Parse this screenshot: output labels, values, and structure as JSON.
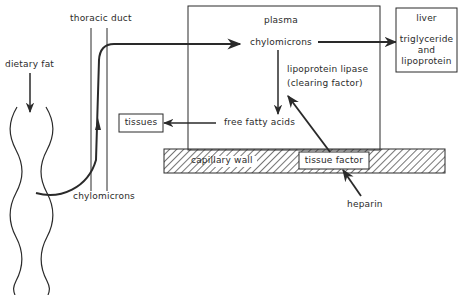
{
  "diagram": {
    "type": "flow-diagram",
    "colors": {
      "ink": "#2a2a2a",
      "background": "#ffffff"
    },
    "labels": {
      "dietary_fat": "dietary fat",
      "thoracic_duct": "thoracic duct",
      "chylomicrons_bottom": "chylomicrons",
      "plasma": "plasma",
      "chylomicrons_plasma": "chylomicrons",
      "lipoprotein_lipase": "lipoprotein lipase",
      "clearing_factor": "(clearing factor)",
      "free_fatty_acids": "free fatty acids",
      "tissues": "tissues",
      "capillary_wall": "capillary wall",
      "tissue_factor": "tissue factor",
      "heparin": "heparin",
      "liver_title": "liver",
      "liver_line1": "triglyceride",
      "liver_line2": "and",
      "liver_line3": "lipoprotein"
    },
    "nodes": [
      {
        "id": "intestine",
        "label": "dietary fat"
      },
      {
        "id": "thoracic-duct",
        "label": "thoracic duct"
      },
      {
        "id": "plasma",
        "label": "plasma"
      },
      {
        "id": "chylomicrons",
        "label": "chylomicrons"
      },
      {
        "id": "free-fatty-acids",
        "label": "free fatty acids"
      },
      {
        "id": "tissues",
        "label": "tissues"
      },
      {
        "id": "liver",
        "label": "liver triglyceride and lipoprotein"
      },
      {
        "id": "capillary-wall",
        "label": "capillary wall"
      },
      {
        "id": "tissue-factor",
        "label": "tissue factor"
      },
      {
        "id": "heparin",
        "label": "heparin"
      }
    ],
    "edges": [
      {
        "from": "dietary fat",
        "to": "intestine"
      },
      {
        "from": "intestine",
        "to": "thoracic-duct",
        "label": "chylomicrons"
      },
      {
        "from": "thoracic-duct",
        "to": "chylomicrons"
      },
      {
        "from": "chylomicrons",
        "to": "liver"
      },
      {
        "from": "chylomicrons",
        "to": "free-fatty-acids",
        "label": "lipoprotein lipase (clearing factor)"
      },
      {
        "from": "free-fatty-acids",
        "to": "tissues"
      },
      {
        "from": "tissue-factor",
        "to": "lipoprotein lipase"
      },
      {
        "from": "heparin",
        "to": "tissue-factor"
      }
    ]
  }
}
